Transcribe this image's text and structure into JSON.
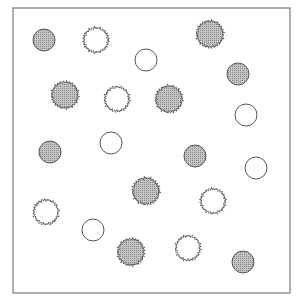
{
  "figure": {
    "frame": {
      "x": 13,
      "y": 8,
      "width": 277,
      "height": 285,
      "stroke": "#7a7a7a"
    },
    "colors": {
      "fill": "#b9b9b9",
      "fill_dark": "#8c8c8c",
      "stroke": "#555555",
      "open_fill": "#ffffff"
    },
    "circles": [
      {
        "x": 44,
        "y": 40,
        "r": 11,
        "filled": true,
        "jagged": false
      },
      {
        "x": 96,
        "y": 40,
        "r": 12,
        "filled": false,
        "jagged": true
      },
      {
        "x": 146,
        "y": 60,
        "r": 11,
        "filled": false,
        "jagged": false
      },
      {
        "x": 210,
        "y": 34,
        "r": 13,
        "filled": true,
        "jagged": true
      },
      {
        "x": 238,
        "y": 74,
        "r": 11,
        "filled": true,
        "jagged": false
      },
      {
        "x": 65,
        "y": 95,
        "r": 13,
        "filled": true,
        "jagged": true
      },
      {
        "x": 117,
        "y": 99,
        "r": 12,
        "filled": false,
        "jagged": true
      },
      {
        "x": 169,
        "y": 99,
        "r": 13,
        "filled": true,
        "jagged": true
      },
      {
        "x": 246,
        "y": 115,
        "r": 11,
        "filled": false,
        "jagged": false
      },
      {
        "x": 50,
        "y": 152,
        "r": 11,
        "filled": true,
        "jagged": false
      },
      {
        "x": 111,
        "y": 143,
        "r": 11,
        "filled": false,
        "jagged": false
      },
      {
        "x": 195,
        "y": 156,
        "r": 11,
        "filled": true,
        "jagged": false
      },
      {
        "x": 256,
        "y": 168,
        "r": 11,
        "filled": false,
        "jagged": false
      },
      {
        "x": 146,
        "y": 191,
        "r": 13,
        "filled": true,
        "jagged": true
      },
      {
        "x": 213,
        "y": 201,
        "r": 12,
        "filled": false,
        "jagged": true
      },
      {
        "x": 46,
        "y": 212,
        "r": 12,
        "filled": false,
        "jagged": true
      },
      {
        "x": 93,
        "y": 230,
        "r": 11,
        "filled": false,
        "jagged": false
      },
      {
        "x": 131,
        "y": 252,
        "r": 13,
        "filled": true,
        "jagged": true
      },
      {
        "x": 188,
        "y": 248,
        "r": 12,
        "filled": false,
        "jagged": true
      },
      {
        "x": 243,
        "y": 262,
        "r": 11,
        "filled": true,
        "jagged": false
      }
    ]
  }
}
